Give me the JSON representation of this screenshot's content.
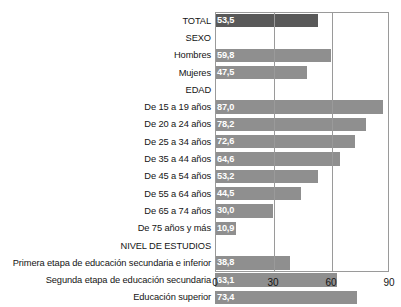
{
  "chart_data": {
    "type": "bar",
    "orientation": "horizontal",
    "title": "",
    "subtitle": "",
    "xlabel": "",
    "ylabel": "",
    "xlim": [
      0,
      90
    ],
    "xticks": [
      0,
      30,
      60,
      90
    ],
    "xtick_labels": [
      "0",
      "30",
      "60",
      "90"
    ],
    "grid": true,
    "legend": null,
    "value_label_format": "comma-decimal",
    "series_name": "Porcentaje",
    "colors": {
      "bar": "#8f8f8f",
      "bar_total": "#595959",
      "value_label": "#ffffff",
      "axis": "#9a9a9a",
      "text": "#141414",
      "background": "#ffffff"
    },
    "categories": [
      "TOTAL",
      "SEXO",
      "Hombres",
      "Mujeres",
      "EDAD",
      "De 15 a 19 años",
      "De 20 a 24 años",
      "De 25 a 34 años",
      "De 35 a 44 años",
      "De 45 a 54 años",
      "De 55 a 64 años",
      "De 65 a 74 años",
      "De 75 años y más",
      "NIVEL DE ESTUDIOS",
      "Primera etapa de educación secundaria e inferior",
      "Segunda etapa de educación secundaria",
      "Educación superior"
    ],
    "values": [
      53.5,
      null,
      59.8,
      47.5,
      null,
      87.0,
      78.2,
      72.6,
      64.6,
      53.2,
      44.5,
      30.0,
      10.9,
      null,
      38.8,
      63.1,
      73.4
    ],
    "rows": [
      {
        "label": "TOTAL",
        "value": 53.5,
        "value_text": "53,5",
        "is_header": false,
        "emphasis": true
      },
      {
        "label": "SEXO",
        "value": null,
        "value_text": "",
        "is_header": true,
        "emphasis": false
      },
      {
        "label": "Hombres",
        "value": 59.8,
        "value_text": "59,8",
        "is_header": false,
        "emphasis": false
      },
      {
        "label": "Mujeres",
        "value": 47.5,
        "value_text": "47,5",
        "is_header": false,
        "emphasis": false
      },
      {
        "label": "EDAD",
        "value": null,
        "value_text": "",
        "is_header": true,
        "emphasis": false
      },
      {
        "label": "De 15 a 19 años",
        "value": 87.0,
        "value_text": "87,0",
        "is_header": false,
        "emphasis": false
      },
      {
        "label": "De 20 a 24 años",
        "value": 78.2,
        "value_text": "78,2",
        "is_header": false,
        "emphasis": false
      },
      {
        "label": "De 25 a 34 años",
        "value": 72.6,
        "value_text": "72,6",
        "is_header": false,
        "emphasis": false
      },
      {
        "label": "De 35 a 44 años",
        "value": 64.6,
        "value_text": "64,6",
        "is_header": false,
        "emphasis": false
      },
      {
        "label": "De 45 a 54 años",
        "value": 53.2,
        "value_text": "53,2",
        "is_header": false,
        "emphasis": false
      },
      {
        "label": "De 55 a 64 años",
        "value": 44.5,
        "value_text": "44,5",
        "is_header": false,
        "emphasis": false
      },
      {
        "label": "De 65 a 74 años",
        "value": 30.0,
        "value_text": "30,0",
        "is_header": false,
        "emphasis": false
      },
      {
        "label": "De 75 años y más",
        "value": 10.9,
        "value_text": "10,9",
        "is_header": false,
        "emphasis": false
      },
      {
        "label": "NIVEL DE ESTUDIOS",
        "value": null,
        "value_text": "",
        "is_header": true,
        "emphasis": false
      },
      {
        "label": "Primera etapa de educación secundaria e inferior",
        "value": 38.8,
        "value_text": "38,8",
        "is_header": false,
        "emphasis": false
      },
      {
        "label": "Segunda etapa de educación secundaria",
        "value": 63.1,
        "value_text": "63,1",
        "is_header": false,
        "emphasis": false
      },
      {
        "label": "Educación superior",
        "value": 73.4,
        "value_text": "73,4",
        "is_header": false,
        "emphasis": false
      }
    ]
  }
}
